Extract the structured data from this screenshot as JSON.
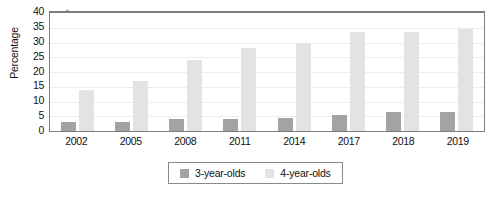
{
  "chart_data": {
    "type": "bar",
    "title": "",
    "xlabel": "",
    "ylabel": "Percentage",
    "ylim": [
      0,
      40
    ],
    "yticks": [
      0,
      5,
      10,
      15,
      20,
      25,
      30,
      35,
      40
    ],
    "grid": true,
    "legend_position": "bottom-center",
    "categories": [
      "2002",
      "2005",
      "2008",
      "2011",
      "2014",
      "2017",
      "2018",
      "2019"
    ],
    "series": [
      {
        "name": "3-year-olds",
        "color": "#a3a3a3",
        "values": [
          3,
          3,
          4,
          4,
          4.5,
          5.5,
          6.5,
          6.5
        ]
      },
      {
        "name": "4-year-olds",
        "color": "#e3e3e3",
        "values": [
          14,
          17,
          24,
          28,
          30,
          33.5,
          33.5,
          34.5
        ]
      }
    ]
  },
  "axes": {
    "y_title": "Percentage"
  },
  "legend": {
    "entries": [
      {
        "label": "3-year-olds",
        "swatch": "legend-swatch-3yo"
      },
      {
        "label": "4-year-olds",
        "swatch": "legend-swatch-4yo"
      }
    ]
  }
}
